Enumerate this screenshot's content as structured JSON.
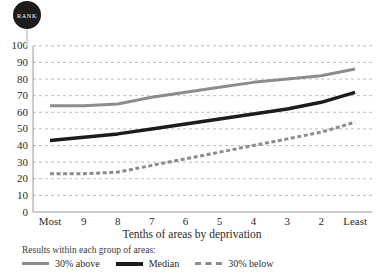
{
  "badge": {
    "label": "RANK",
    "icon": "rank-pin-badge",
    "color": "#1c1c1c"
  },
  "chart_data": {
    "type": "line",
    "title": "",
    "xlabel": "Tenths of areas by deprivation",
    "ylabel": "",
    "categories": [
      "Most",
      "9",
      "8",
      "7",
      "6",
      "5",
      "4",
      "3",
      "2",
      "Least"
    ],
    "ylim": [
      0,
      100
    ],
    "ytick_labels": [
      "100",
      "90",
      "80",
      "70",
      "60",
      "50",
      "40",
      "30",
      "20",
      "10",
      "0"
    ],
    "ytick_values": [
      100,
      90,
      80,
      70,
      60,
      50,
      40,
      30,
      20,
      10,
      0
    ],
    "grid": true,
    "grid_style": "dashed-horizontal",
    "legend_position": "bottom-left",
    "legend_title": "Results within each group of areas:",
    "series": [
      {
        "name": "30% above",
        "style": "solid",
        "color": "#8c8c8c",
        "width": 3,
        "values": [
          64,
          64,
          65,
          69,
          72,
          75,
          78,
          80,
          82,
          86
        ]
      },
      {
        "name": "Median",
        "style": "solid",
        "color": "#1c1c1c",
        "width": 3.5,
        "values": [
          43,
          45,
          47,
          50,
          53,
          56,
          59,
          62,
          66,
          72
        ]
      },
      {
        "name": "30% below",
        "style": "dashed",
        "color": "#8c8c8c",
        "width": 3,
        "values": [
          23,
          23,
          24,
          28,
          32,
          36,
          40,
          44,
          48,
          54
        ]
      }
    ]
  }
}
